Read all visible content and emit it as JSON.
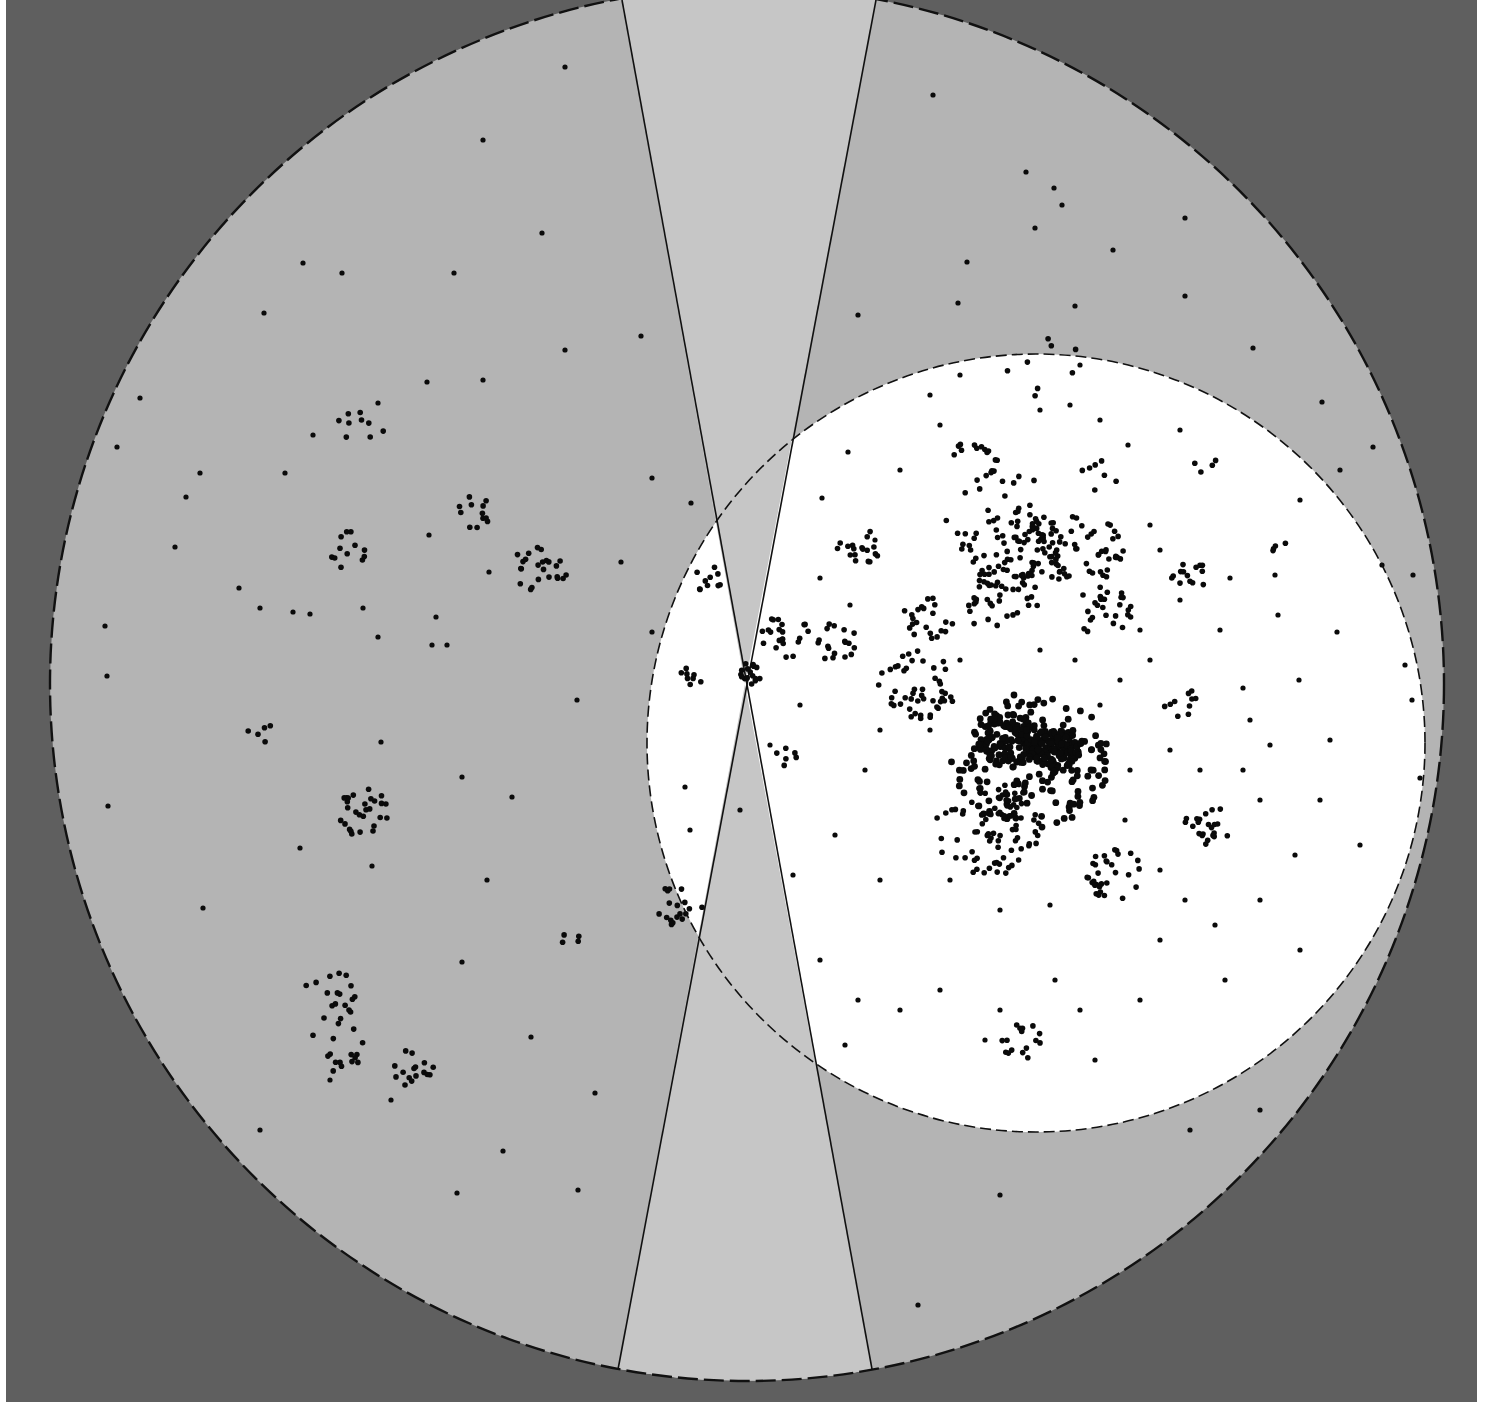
{
  "diagram": {
    "kind": "galaxy-sky-map",
    "colors": {
      "background_panel": "#5f5f5f",
      "outer_disk": "#b4b4b4",
      "zone_of_avoidance": "#c6c6c6",
      "highlight_disk": "#ffffff",
      "boundary_line": "#111111",
      "galaxy_dot": "#0a0a0a"
    },
    "outer_circle": {
      "cx": 747,
      "cy": 684,
      "r": 697,
      "dashed": true
    },
    "highlight_circle": {
      "cx": 1036,
      "cy": 743,
      "r": 389,
      "dashed": true
    },
    "zone_of_avoidance": {
      "apex": [
        745,
        684
      ],
      "upper_left": [
        622,
        0
      ],
      "upper_right": [
        876,
        0
      ],
      "lower_left": [
        616,
        1380
      ],
      "lower_right": [
        874,
        1380
      ]
    },
    "clusters": [
      {
        "name": "cluster-left-1",
        "cx": 360,
        "cy": 430,
        "r": 28,
        "n": 9
      },
      {
        "name": "cluster-left-2",
        "cx": 478,
        "cy": 510,
        "r": 22,
        "n": 12
      },
      {
        "name": "cluster-left-3",
        "cx": 355,
        "cy": 552,
        "r": 26,
        "n": 12
      },
      {
        "name": "cluster-left-4",
        "cx": 540,
        "cy": 567,
        "r": 28,
        "n": 24
      },
      {
        "name": "cluster-left-5",
        "cx": 362,
        "cy": 812,
        "r": 28,
        "n": 28
      },
      {
        "name": "cluster-left-6",
        "cx": 330,
        "cy": 995,
        "r": 30,
        "n": 16
      },
      {
        "name": "cluster-left-7",
        "cx": 330,
        "cy": 1045,
        "r": 36,
        "n": 18
      },
      {
        "name": "cluster-left-8",
        "cx": 413,
        "cy": 1068,
        "r": 22,
        "n": 16
      },
      {
        "name": "cluster-left-9",
        "cx": 262,
        "cy": 733,
        "r": 14,
        "n": 5
      },
      {
        "name": "cluster-left-10",
        "cx": 570,
        "cy": 940,
        "r": 10,
        "n": 4
      },
      {
        "name": "cluster-center-1",
        "cx": 707,
        "cy": 578,
        "r": 18,
        "n": 10
      },
      {
        "name": "cluster-center-2",
        "cx": 690,
        "cy": 678,
        "r": 12,
        "n": 8
      },
      {
        "name": "cluster-center-3",
        "cx": 747,
        "cy": 674,
        "r": 14,
        "n": 16
      },
      {
        "name": "cluster-center-4",
        "cx": 785,
        "cy": 637,
        "r": 26,
        "n": 22
      },
      {
        "name": "cluster-center-5",
        "cx": 835,
        "cy": 642,
        "r": 22,
        "n": 18
      },
      {
        "name": "cluster-center-6",
        "cx": 680,
        "cy": 905,
        "r": 26,
        "n": 18
      },
      {
        "name": "cluster-right-1",
        "cx": 858,
        "cy": 545,
        "r": 24,
        "n": 18
      },
      {
        "name": "cluster-right-2",
        "cx": 975,
        "cy": 460,
        "r": 24,
        "n": 16
      },
      {
        "name": "cluster-right-3",
        "cx": 1010,
        "cy": 548,
        "r": 50,
        "n": 70
      },
      {
        "name": "cluster-right-4",
        "cx": 1080,
        "cy": 550,
        "r": 44,
        "n": 55
      },
      {
        "name": "cluster-right-5",
        "cx": 1000,
        "cy": 600,
        "r": 40,
        "n": 35
      },
      {
        "name": "cluster-right-6",
        "cx": 1105,
        "cy": 612,
        "r": 30,
        "n": 28
      },
      {
        "name": "cluster-right-7",
        "cx": 928,
        "cy": 620,
        "r": 26,
        "n": 22
      },
      {
        "name": "cluster-right-8",
        "cx": 918,
        "cy": 685,
        "r": 40,
        "n": 48
      },
      {
        "name": "cluster-right-9",
        "cx": 1005,
        "cy": 520,
        "r": 60,
        "n": 30
      },
      {
        "name": "cluster-core-1",
        "cx": 1010,
        "cy": 740,
        "r": 32,
        "n": 120
      },
      {
        "name": "cluster-core-2",
        "cx": 1055,
        "cy": 748,
        "r": 24,
        "n": 110
      },
      {
        "name": "cluster-core-halo",
        "cx": 1030,
        "cy": 760,
        "r": 80,
        "n": 160
      },
      {
        "name": "cluster-right-10",
        "cx": 990,
        "cy": 830,
        "r": 55,
        "n": 85
      },
      {
        "name": "cluster-right-11",
        "cx": 1115,
        "cy": 875,
        "r": 30,
        "n": 32
      },
      {
        "name": "cluster-right-12",
        "cx": 1208,
        "cy": 825,
        "r": 24,
        "n": 22
      },
      {
        "name": "cluster-right-13",
        "cx": 1180,
        "cy": 702,
        "r": 18,
        "n": 10
      },
      {
        "name": "cluster-right-14",
        "cx": 1190,
        "cy": 578,
        "r": 20,
        "n": 14
      },
      {
        "name": "cluster-right-15",
        "cx": 1022,
        "cy": 1040,
        "r": 22,
        "n": 16
      },
      {
        "name": "cluster-right-16",
        "cx": 1100,
        "cy": 475,
        "r": 20,
        "n": 7
      },
      {
        "name": "cluster-right-17",
        "cx": 1205,
        "cy": 465,
        "r": 12,
        "n": 4
      },
      {
        "name": "cluster-right-18",
        "cx": 1280,
        "cy": 550,
        "r": 10,
        "n": 4
      },
      {
        "name": "cluster-right-19",
        "cx": 790,
        "cy": 755,
        "r": 16,
        "n": 6
      },
      {
        "name": "cluster-right-20",
        "cx": 1040,
        "cy": 365,
        "r": 40,
        "n": 8
      }
    ],
    "field_galaxies": [
      [
        565,
        67
      ],
      [
        483,
        140
      ],
      [
        542,
        233
      ],
      [
        454,
        273
      ],
      [
        342,
        273
      ],
      [
        303,
        263
      ],
      [
        264,
        313
      ],
      [
        641,
        336
      ],
      [
        565,
        350
      ],
      [
        483,
        380
      ],
      [
        427,
        382
      ],
      [
        378,
        403
      ],
      [
        313,
        435
      ],
      [
        285,
        473
      ],
      [
        200,
        473
      ],
      [
        186,
        497
      ],
      [
        140,
        398
      ],
      [
        117,
        447
      ],
      [
        175,
        547
      ],
      [
        105,
        626
      ],
      [
        107,
        676
      ],
      [
        239,
        588
      ],
      [
        260,
        608
      ],
      [
        293,
        612
      ],
      [
        310,
        614
      ],
      [
        363,
        608
      ],
      [
        378,
        637
      ],
      [
        436,
        617
      ],
      [
        447,
        645
      ],
      [
        429,
        535
      ],
      [
        489,
        572
      ],
      [
        621,
        562
      ],
      [
        652,
        478
      ],
      [
        691,
        503
      ],
      [
        432,
        645
      ],
      [
        462,
        777
      ],
      [
        381,
        742
      ],
      [
        512,
        797
      ],
      [
        577,
        700
      ],
      [
        487,
        880
      ],
      [
        462,
        962
      ],
      [
        531,
        1037
      ],
      [
        595,
        1093
      ],
      [
        260,
        1130
      ],
      [
        203,
        908
      ],
      [
        300,
        848
      ],
      [
        372,
        866
      ],
      [
        108,
        806
      ],
      [
        457,
        1193
      ],
      [
        503,
        1151
      ],
      [
        578,
        1190
      ],
      [
        391,
        1100
      ],
      [
        330,
        1080
      ],
      [
        933,
        95
      ],
      [
        1026,
        172
      ],
      [
        1054,
        188
      ],
      [
        1062,
        205
      ],
      [
        1035,
        228
      ],
      [
        1185,
        218
      ],
      [
        967,
        262
      ],
      [
        1113,
        250
      ],
      [
        1185,
        296
      ],
      [
        1075,
        306
      ],
      [
        958,
        303
      ],
      [
        858,
        315
      ],
      [
        1253,
        348
      ],
      [
        1322,
        402
      ],
      [
        1373,
        447
      ],
      [
        1413,
        575
      ],
      [
        1405,
        665
      ],
      [
        1412,
        700
      ],
      [
        1420,
        778
      ],
      [
        1382,
        565
      ],
      [
        1337,
        632
      ],
      [
        1299,
        680
      ],
      [
        1243,
        688
      ],
      [
        1250,
        720
      ],
      [
        1270,
        745
      ],
      [
        1360,
        845
      ],
      [
        1300,
        950
      ],
      [
        1350,
        1040
      ],
      [
        1260,
        1110
      ],
      [
        1190,
        1130
      ],
      [
        1000,
        1195
      ],
      [
        918,
        1305
      ],
      [
        848,
        452
      ],
      [
        822,
        498
      ],
      [
        820,
        578
      ],
      [
        850,
        605
      ],
      [
        900,
        470
      ],
      [
        875,
        540
      ],
      [
        940,
        425
      ],
      [
        1128,
        445
      ],
      [
        1150,
        525
      ],
      [
        1160,
        550
      ],
      [
        1230,
        578
      ],
      [
        1275,
        575
      ],
      [
        1278,
        615
      ],
      [
        1180,
        600
      ],
      [
        1220,
        630
      ],
      [
        1260,
        900
      ],
      [
        1225,
        980
      ],
      [
        1215,
        925
      ],
      [
        1160,
        940
      ],
      [
        1140,
        1000
      ],
      [
        1095,
        1060
      ],
      [
        1080,
        1010
      ],
      [
        1055,
        980
      ],
      [
        1000,
        1010
      ],
      [
        985,
        1040
      ],
      [
        940,
        990
      ],
      [
        900,
        1010
      ],
      [
        858,
        1000
      ],
      [
        820,
        960
      ],
      [
        845,
        1045
      ],
      [
        880,
        880
      ],
      [
        835,
        835
      ],
      [
        793,
        875
      ],
      [
        770,
        745
      ],
      [
        685,
        787
      ],
      [
        652,
        632
      ],
      [
        690,
        830
      ],
      [
        740,
        810
      ],
      [
        800,
        705
      ],
      [
        1340,
        470
      ],
      [
        1300,
        500
      ],
      [
        1330,
        740
      ],
      [
        1243,
        770
      ],
      [
        1260,
        800
      ],
      [
        1295,
        855
      ],
      [
        1320,
        800
      ],
      [
        1170,
        750
      ],
      [
        1200,
        770
      ],
      [
        1130,
        770
      ],
      [
        1100,
        705
      ],
      [
        1120,
        680
      ],
      [
        1150,
        660
      ],
      [
        1140,
        630
      ],
      [
        1040,
        650
      ],
      [
        1075,
        660
      ],
      [
        960,
        660
      ],
      [
        930,
        730
      ],
      [
        880,
        730
      ],
      [
        865,
        770
      ],
      [
        950,
        880
      ],
      [
        1050,
        905
      ],
      [
        1000,
        910
      ],
      [
        1125,
        820
      ],
      [
        1160,
        870
      ],
      [
        1185,
        900
      ],
      [
        960,
        375
      ],
      [
        930,
        395
      ],
      [
        1080,
        365
      ],
      [
        1070,
        405
      ],
      [
        1040,
        410
      ],
      [
        1100,
        420
      ],
      [
        1180,
        430
      ]
    ],
    "seed": 1377
  }
}
